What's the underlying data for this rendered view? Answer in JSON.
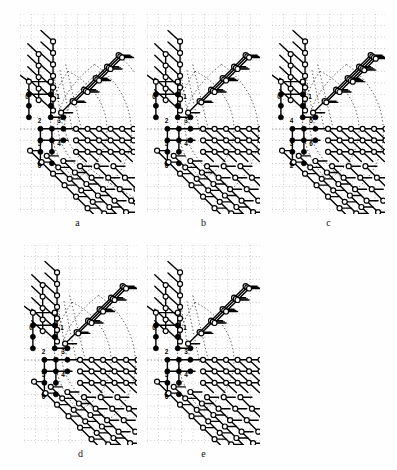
{
  "figure": {
    "type": "multi-panel-lattice-diagram",
    "panel_count": 5,
    "rows": 2,
    "background_color": "#ffffff",
    "grid": {
      "style": "dotted",
      "color": "#b9b9b9",
      "spacing_px": 11.5,
      "visible": true
    },
    "legend_semantics": {
      "filled_node": "occupied / seed vertex (black disc)",
      "open_node": "unoccupied / growth vertex (white circle, black outline)",
      "solid_edge": "lattice bond",
      "dotted_curve": "boundary contour"
    }
  },
  "panels": [
    {
      "id": "a",
      "caption": "a",
      "x": 20,
      "y": 14,
      "w": 115,
      "h": 200,
      "labels": [
        {
          "text": "0",
          "gx": 0.5,
          "gy": 7.0
        },
        {
          "text": "1",
          "gx": 3.2,
          "gy": 7.0
        },
        {
          "text": "2",
          "gx": 1.6,
          "gy": 9.1
        },
        {
          "text": "3",
          "gx": 3.3,
          "gy": 9.1
        },
        {
          "text": "5",
          "gx": 1.6,
          "gy": 11.1
        },
        {
          "text": "4",
          "gx": 3.3,
          "gy": 11.1
        },
        {
          "text": "6",
          "gx": 1.6,
          "gy": 13.0
        }
      ],
      "contours": 3
    },
    {
      "id": "b",
      "caption": "b",
      "x": 147,
      "y": 14,
      "w": 113,
      "h": 200,
      "labels": [
        {
          "text": "0",
          "gx": 0.5,
          "gy": 7.0
        },
        {
          "text": "1",
          "gx": 3.2,
          "gy": 7.0
        },
        {
          "text": "2",
          "gx": 1.6,
          "gy": 9.1
        },
        {
          "text": "3",
          "gx": 3.3,
          "gy": 9.1
        },
        {
          "text": "5",
          "gx": 1.6,
          "gy": 11.1
        },
        {
          "text": "4",
          "gx": 3.3,
          "gy": 11.1
        },
        {
          "text": "6",
          "gx": 1.6,
          "gy": 13.0
        }
      ],
      "contours": 2
    },
    {
      "id": "c",
      "caption": "c",
      "x": 272,
      "y": 14,
      "w": 113,
      "h": 200,
      "labels": [
        {
          "text": "0",
          "gx": 0.5,
          "gy": 7.0
        },
        {
          "text": "1",
          "gx": 3.2,
          "gy": 7.0
        },
        {
          "text": "4",
          "gx": 1.6,
          "gy": 9.1
        },
        {
          "text": "5",
          "gx": 3.3,
          "gy": 9.1
        },
        {
          "text": "3",
          "gx": 1.6,
          "gy": 11.1
        },
        {
          "text": "6",
          "gx": 3.3,
          "gy": 11.1
        },
        {
          "text": "2",
          "gx": 1.6,
          "gy": 13.0
        }
      ],
      "contours": 2
    },
    {
      "id": "d",
      "caption": "d",
      "x": 24,
      "y": 245,
      "w": 113,
      "h": 200,
      "labels": [
        {
          "text": "0",
          "gx": 0.5,
          "gy": 7.0
        },
        {
          "text": "1",
          "gx": 3.2,
          "gy": 7.0
        },
        {
          "text": "2",
          "gx": 1.6,
          "gy": 9.1
        },
        {
          "text": "3",
          "gx": 3.3,
          "gy": 9.1
        },
        {
          "text": "5",
          "gx": 1.6,
          "gy": 11.1
        },
        {
          "text": "4",
          "gx": 3.3,
          "gy": 11.1
        },
        {
          "text": "6",
          "gx": 1.6,
          "gy": 13.0
        }
      ],
      "contours": 2
    },
    {
      "id": "e",
      "caption": "e",
      "x": 147,
      "y": 245,
      "w": 113,
      "h": 200,
      "labels": [
        {
          "text": "0",
          "gx": 0.5,
          "gy": 7.0
        },
        {
          "text": "1",
          "gx": 3.2,
          "gy": 7.0
        },
        {
          "text": "2",
          "gx": 1.6,
          "gy": 9.1
        },
        {
          "text": "3",
          "gx": 3.3,
          "gy": 9.1
        },
        {
          "text": "5",
          "gx": 1.6,
          "gy": 11.1
        },
        {
          "text": "4",
          "gx": 3.3,
          "gy": 11.1
        },
        {
          "text": "6",
          "gx": 1.6,
          "gy": 13.0
        }
      ],
      "contours": 1
    }
  ],
  "style": {
    "node_fill_color": "#000000",
    "node_open_fill": "#ffffff",
    "node_stroke": "#000000",
    "edge_color": "#000000",
    "edge_width": 1.4,
    "node_radius": 2.5,
    "label_color": "#000000",
    "caption_color": "#111111"
  }
}
